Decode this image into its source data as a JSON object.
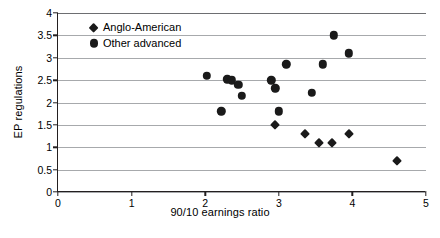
{
  "chart_data": {
    "type": "scatter",
    "title": "",
    "xlabel": "90/10 earnings ratio",
    "ylabel": "EP regulations",
    "xlim": [
      0,
      5
    ],
    "ylim": [
      0,
      4
    ],
    "xticks": [
      "0",
      "1",
      "2",
      "3",
      "4",
      "5"
    ],
    "yticks": [
      "0",
      "0.5",
      "1",
      "1.5",
      "2",
      "2.5",
      "3",
      "3.5",
      "4"
    ],
    "grid": "horizontal",
    "legend_position": "top-left-inside",
    "series": [
      {
        "name": "Anglo-American",
        "marker": "diamond",
        "color": "#1a1a1a",
        "points": [
          {
            "x": 2.95,
            "y": 1.5
          },
          {
            "x": 3.35,
            "y": 1.3
          },
          {
            "x": 3.55,
            "y": 1.1
          },
          {
            "x": 3.72,
            "y": 1.1
          },
          {
            "x": 3.95,
            "y": 1.3
          },
          {
            "x": 4.6,
            "y": 0.7
          }
        ]
      },
      {
        "name": "Other advanced",
        "marker": "circle",
        "color": "#1a1a1a",
        "points": [
          {
            "x": 2.02,
            "y": 2.6
          },
          {
            "x": 2.22,
            "y": 1.8
          },
          {
            "x": 2.3,
            "y": 2.52
          },
          {
            "x": 2.36,
            "y": 2.5
          },
          {
            "x": 2.45,
            "y": 2.4
          },
          {
            "x": 2.5,
            "y": 2.15
          },
          {
            "x": 2.9,
            "y": 2.5
          },
          {
            "x": 2.95,
            "y": 2.32
          },
          {
            "x": 3.0,
            "y": 1.8
          },
          {
            "x": 3.1,
            "y": 2.85
          },
          {
            "x": 3.45,
            "y": 2.22
          },
          {
            "x": 3.6,
            "y": 2.85
          },
          {
            "x": 3.75,
            "y": 3.5
          },
          {
            "x": 3.95,
            "y": 3.1
          }
        ]
      }
    ]
  },
  "legend": {
    "items": [
      {
        "label": "Anglo-American",
        "marker": "diamond"
      },
      {
        "label": "Other advanced",
        "marker": "circle"
      }
    ]
  },
  "axes": {
    "x_title": "90/10 earnings ratio",
    "y_title": "EP regulations"
  }
}
